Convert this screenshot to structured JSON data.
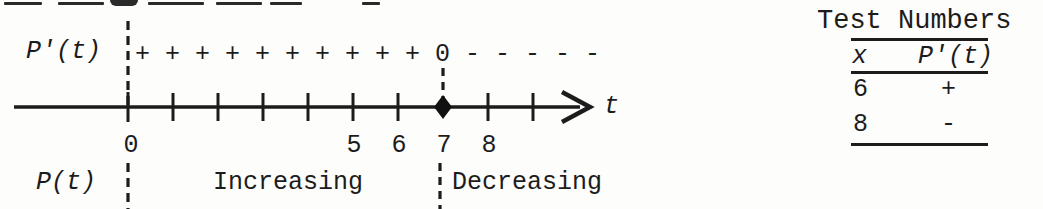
{
  "sign_row": {
    "label": "P'(t)",
    "signs": "+ + + + + + + + + + 0 - - - - -"
  },
  "number_line": {
    "axis_label": "t",
    "tick_labels": [
      {
        "text": "0"
      },
      {
        "text": "5"
      },
      {
        "text": "6"
      },
      {
        "text": "7"
      },
      {
        "text": "8"
      }
    ],
    "critical_point": "7"
  },
  "behavior_row": {
    "label": "P(t)",
    "increasing": "Increasing",
    "decreasing": "Decreasing"
  },
  "table": {
    "title": "Test Numbers",
    "col_x": "x",
    "col_p": "P'(t)",
    "rows": [
      {
        "x": "6",
        "sign": "+"
      },
      {
        "x": "8",
        "sign": "-"
      }
    ]
  }
}
